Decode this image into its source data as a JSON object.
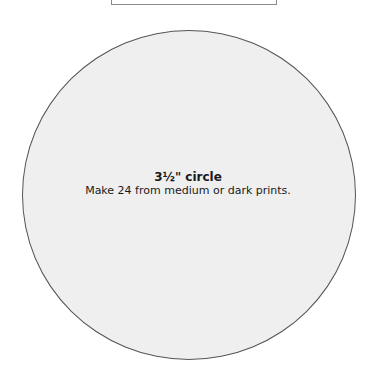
{
  "template": {
    "shape": "circle",
    "title": "3½\" circle",
    "instruction": "Make 24 from medium or dark prints."
  },
  "colors": {
    "circle_fill": "#efefef",
    "circle_outline": "#555555",
    "box_outline": "#8a8a8a"
  }
}
